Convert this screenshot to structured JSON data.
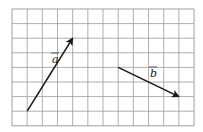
{
  "grid": {
    "origin_x": 12,
    "origin_y": 9,
    "cols": 12,
    "rows": 8,
    "cell_w": 15.17,
    "cell_h": 14.6,
    "line_color": "#9a9a9a",
    "border_color": "#888888"
  },
  "vectors": [
    {
      "name": "a",
      "label": "a",
      "from": [
        1,
        7
      ],
      "to": [
        4,
        2
      ],
      "label_pos": [
        52,
        63
      ],
      "color": "#1a1a1a"
    },
    {
      "name": "b",
      "label": "b",
      "from": [
        7,
        4
      ],
      "to": [
        11,
        6
      ],
      "label_pos": [
        150,
        77
      ],
      "color": "#1a1a1a"
    }
  ]
}
